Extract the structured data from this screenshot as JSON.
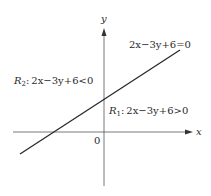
{
  "diagram": {
    "axes": {
      "x_label": "x",
      "y_label": "y",
      "origin_label": "0"
    },
    "line": {
      "equation": "2x−3y+6=0"
    },
    "regions": [
      {
        "name": "R",
        "subscript": "1",
        "inequality": ": 2x−3y+6>0"
      },
      {
        "name": "R",
        "subscript": "2",
        "inequality": ": 2x−3y+6<0"
      }
    ],
    "colors": {
      "stroke": "#2a2a2a",
      "background": "#ffffff"
    }
  }
}
